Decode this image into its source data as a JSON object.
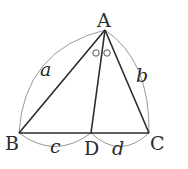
{
  "diagram": {
    "type": "geometry",
    "points": {
      "A": {
        "label": "A",
        "x": 105,
        "y": 30
      },
      "B": {
        "label": "B",
        "x": 19,
        "y": 133
      },
      "C": {
        "label": "C",
        "x": 149,
        "y": 133
      },
      "D": {
        "label": "D",
        "x": 91,
        "y": 133
      }
    },
    "segments": [
      {
        "from": "A",
        "to": "B"
      },
      {
        "from": "A",
        "to": "C"
      },
      {
        "from": "B",
        "to": "C"
      },
      {
        "from": "A",
        "to": "D"
      }
    ],
    "lengths": {
      "AB": {
        "label": "a"
      },
      "AC": {
        "label": "b"
      },
      "BD": {
        "label": "c"
      },
      "DC": {
        "label": "d"
      }
    },
    "angle_marks": {
      "symbol": "circle",
      "count": 2,
      "meaning": "angle BAD equals angle DAC"
    },
    "colors": {
      "line": "#2b2b2b",
      "arc": "#9a9a9a",
      "text": "#2b2b2b"
    }
  }
}
